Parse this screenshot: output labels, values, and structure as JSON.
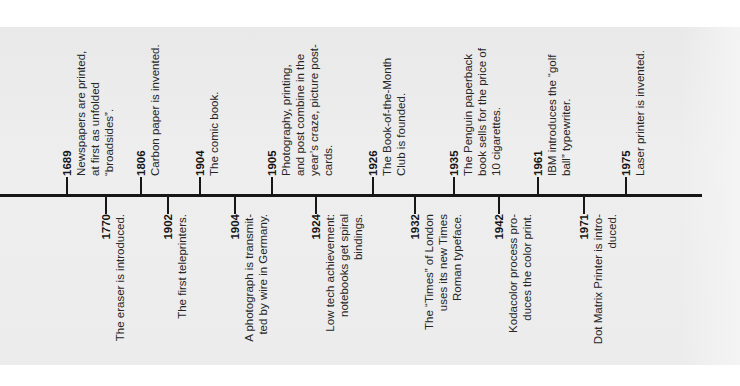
{
  "timeline": {
    "axis_color": "#161616",
    "upper_events": [
      {
        "year": "1689",
        "tick_x": 67,
        "lines": [
          "Newspapers are printed,",
          "at first as unfolded",
          "“broadsides”."
        ]
      },
      {
        "year": "1806",
        "tick_x": 141,
        "lines": [
          "Carbon paper is invented."
        ]
      },
      {
        "year": "1904",
        "tick_x": 200,
        "lines": [
          "The comic book."
        ]
      },
      {
        "year": "1905",
        "tick_x": 272,
        "lines": [
          "Photography, printing,",
          "and post combine in the",
          "year’s craze, picture post-",
          "cards."
        ]
      },
      {
        "year": "1926",
        "tick_x": 373,
        "lines": [
          "The Book-of-the-Month",
          "Club is founded."
        ]
      },
      {
        "year": "1935",
        "tick_x": 454,
        "lines": [
          "The Penguin paperback",
          "book sells for the price of",
          "10 cigarettes."
        ]
      },
      {
        "year": "1961",
        "tick_x": 538,
        "lines": [
          "IBM introduces the “golf",
          "ball” typewriter."
        ]
      },
      {
        "year": "1975",
        "tick_x": 626,
        "lines": [
          "Laser printer is invented."
        ]
      }
    ],
    "lower_events": [
      {
        "year": "1770",
        "tick_x": 106,
        "lines": [
          "The eraser is introduced."
        ]
      },
      {
        "year": "1902",
        "tick_x": 168,
        "lines": [
          "The first teleprinters."
        ]
      },
      {
        "year": "1904",
        "tick_x": 235,
        "lines": [
          "A photograph is transmit-",
          "ted by wire in Germany."
        ]
      },
      {
        "year": "1924",
        "tick_x": 316,
        "lines": [
          "Low tech achievement:",
          "notebooks get spiral",
          "bindings."
        ]
      },
      {
        "year": "1932",
        "tick_x": 415,
        "lines": [
          "The “Times” of London",
          "uses its new Times",
          "Roman typeface."
        ]
      },
      {
        "year": "1942",
        "tick_x": 499,
        "lines": [
          "Kodacolor process pro-",
          "duces the color print."
        ]
      },
      {
        "year": "1971",
        "tick_x": 584,
        "lines": [
          "Dot Matrix Printer is intro-",
          "duced."
        ]
      }
    ]
  }
}
